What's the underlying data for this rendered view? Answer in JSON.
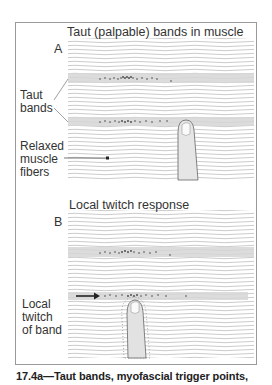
{
  "panel_a": {
    "letter": "A",
    "title": "Taut (palpable) bands in muscle",
    "labels": {
      "taut_bands": [
        "Taut",
        "bands"
      ],
      "relaxed": [
        "Relaxed",
        "muscle",
        "fibers"
      ]
    }
  },
  "panel_b": {
    "letter": "B",
    "title": "Local twitch response",
    "labels": {
      "local_twitch": [
        "Local",
        "twitch",
        "of band"
      ]
    }
  },
  "caption": "17.4a—Taut bands, myofascial trigger points,",
  "colors": {
    "fiber": "#b5b5b5",
    "band": "#d6d6d6",
    "dots": "#444444",
    "frame": "#9a9a9a",
    "text": "#333333"
  }
}
